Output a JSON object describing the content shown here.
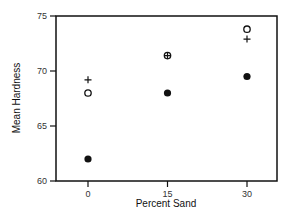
{
  "chart_data": {
    "type": "scatter",
    "title": "",
    "xlabel": "Percent Sand",
    "ylabel": "Mean Hardness",
    "xlim": [
      -5,
      36
    ],
    "ylim": [
      60,
      75
    ],
    "x_ticks": [
      0,
      15,
      30
    ],
    "x_tick_labels": [
      "0",
      "15",
      "30"
    ],
    "y_ticks": [
      60,
      65,
      70,
      75
    ],
    "y_tick_labels": [
      "60",
      "65",
      "70",
      "75"
    ],
    "grid": false,
    "legend": null,
    "series": [
      {
        "name": "plus",
        "marker": "plus",
        "x": [
          0,
          15,
          30
        ],
        "y": [
          69.2,
          71.4,
          72.9
        ]
      },
      {
        "name": "open-circle",
        "marker": "open-circle",
        "x": [
          0,
          15,
          30
        ],
        "y": [
          68.0,
          71.4,
          73.8
        ]
      },
      {
        "name": "filled-circle",
        "marker": "filled-circle",
        "x": [
          0,
          15,
          30
        ],
        "y": [
          62.0,
          68.0,
          69.5
        ]
      }
    ]
  }
}
